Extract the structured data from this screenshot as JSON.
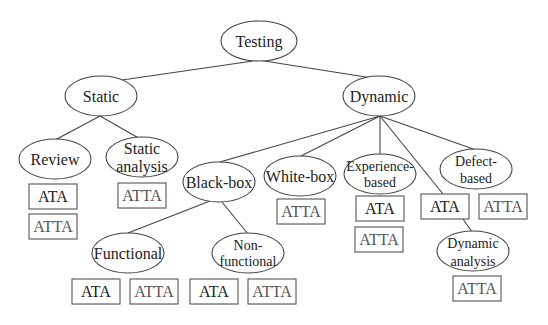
{
  "diagram": {
    "type": "tree",
    "nodes": {
      "testing": "Testing",
      "static": "Static",
      "dynamic": "Dynamic",
      "review": "Review",
      "static_analysis": [
        "Static",
        "analysis"
      ],
      "black_box": "Black-box",
      "white_box": "White-box",
      "experience_based": [
        "Experience-",
        "based"
      ],
      "defect_based": [
        "Defect-",
        "based"
      ],
      "functional": "Functional",
      "non_functional": [
        "Non-",
        "functional"
      ],
      "dynamic_analysis": [
        "Dynamic",
        "analysis"
      ]
    },
    "boxes": {
      "review_ata": "ATA",
      "review_atta": "ATTA",
      "static_analysis_atta": "ATTA",
      "white_box_atta": "ATTA",
      "experience_ata": "ATA",
      "experience_atta": "ATTA",
      "dynamic_ata": "ATA",
      "defect_atta": "ATTA",
      "dynamic_analysis_atta": "ATTA",
      "functional_ata": "ATA",
      "functional_atta": "ATTA",
      "non_functional_ata": "ATA",
      "non_functional_atta": "ATTA"
    },
    "edges": [
      [
        "Testing",
        "Static"
      ],
      [
        "Testing",
        "Dynamic"
      ],
      [
        "Static",
        "Review"
      ],
      [
        "Static",
        "Static analysis"
      ],
      [
        "Dynamic",
        "Black-box"
      ],
      [
        "Dynamic",
        "White-box"
      ],
      [
        "Dynamic",
        "Experience-based"
      ],
      [
        "Dynamic",
        "ATA"
      ],
      [
        "Dynamic",
        "Defect-based"
      ],
      [
        "Black-box",
        "Functional"
      ],
      [
        "Black-box",
        "Non-functional"
      ],
      [
        "ATA",
        "Dynamic analysis"
      ]
    ]
  }
}
